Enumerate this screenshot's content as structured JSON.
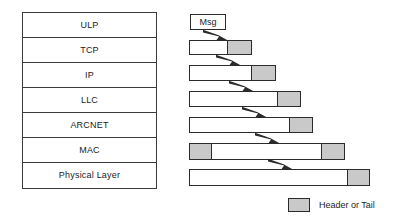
{
  "diagram": {
    "colors": {
      "header_fill": "#c9c9c9",
      "payload_fill": "#ffffff",
      "stroke": "#2b2b2b",
      "text": "#1c1c1c"
    }
  },
  "stack": {
    "name": "protocol-stack",
    "layers": [
      {
        "label": "ULP"
      },
      {
        "label": "TCP"
      },
      {
        "label": "IP"
      },
      {
        "label": "LLC"
      },
      {
        "label": "ARCNET"
      },
      {
        "label": "MAC"
      },
      {
        "label": "Physical Layer"
      }
    ]
  },
  "message": {
    "label": "Msg",
    "x": 190,
    "y": 14,
    "width": 36,
    "height": 16
  },
  "pdus": [
    {
      "name": "tcp-pdu",
      "layer": "TCP",
      "x": 189,
      "y": 40,
      "height": 15,
      "segments": [
        {
          "kind": "payload",
          "width": 39
        },
        {
          "kind": "header",
          "width": 24
        }
      ]
    },
    {
      "name": "ip-pdu",
      "layer": "IP",
      "x": 189,
      "y": 65,
      "height": 16,
      "segments": [
        {
          "kind": "payload",
          "width": 63
        },
        {
          "kind": "header",
          "width": 24
        }
      ]
    },
    {
      "name": "llc-pdu",
      "layer": "LLC",
      "x": 189,
      "y": 91,
      "height": 16,
      "segments": [
        {
          "kind": "payload",
          "width": 89
        },
        {
          "kind": "header",
          "width": 23
        }
      ]
    },
    {
      "name": "arcnet-pdu",
      "layer": "ARCNET",
      "x": 189,
      "y": 117,
      "height": 16,
      "segments": [
        {
          "kind": "payload",
          "width": 101
        },
        {
          "kind": "header",
          "width": 23
        }
      ]
    },
    {
      "name": "mac-pdu",
      "layer": "MAC",
      "x": 189,
      "y": 143,
      "height": 17,
      "segments": [
        {
          "kind": "header",
          "width": 23
        },
        {
          "kind": "payload",
          "width": 110
        },
        {
          "kind": "header",
          "width": 23
        }
      ]
    },
    {
      "name": "physical-pdu",
      "layer": "Physical Layer",
      "x": 189,
      "y": 169,
      "height": 17,
      "segments": [
        {
          "kind": "payload",
          "width": 159
        },
        {
          "kind": "header",
          "width": 22
        }
      ]
    }
  ],
  "arrows": [
    {
      "name": "arrow-msg-to-tcp",
      "x": 203,
      "y": 29,
      "w": 26,
      "h": 12
    },
    {
      "name": "arrow-tcp-to-ip",
      "x": 216,
      "y": 54,
      "w": 26,
      "h": 12
    },
    {
      "name": "arrow-ip-to-llc",
      "x": 229,
      "y": 80,
      "w": 26,
      "h": 12
    },
    {
      "name": "arrow-llc-to-arcnet",
      "x": 242,
      "y": 106,
      "w": 26,
      "h": 12
    },
    {
      "name": "arrow-arcnet-to-mac",
      "x": 255,
      "y": 132,
      "w": 26,
      "h": 12
    },
    {
      "name": "arrow-mac-to-physical",
      "x": 268,
      "y": 158,
      "w": 26,
      "h": 12
    }
  ],
  "legend": {
    "label": "Header or Tail"
  }
}
